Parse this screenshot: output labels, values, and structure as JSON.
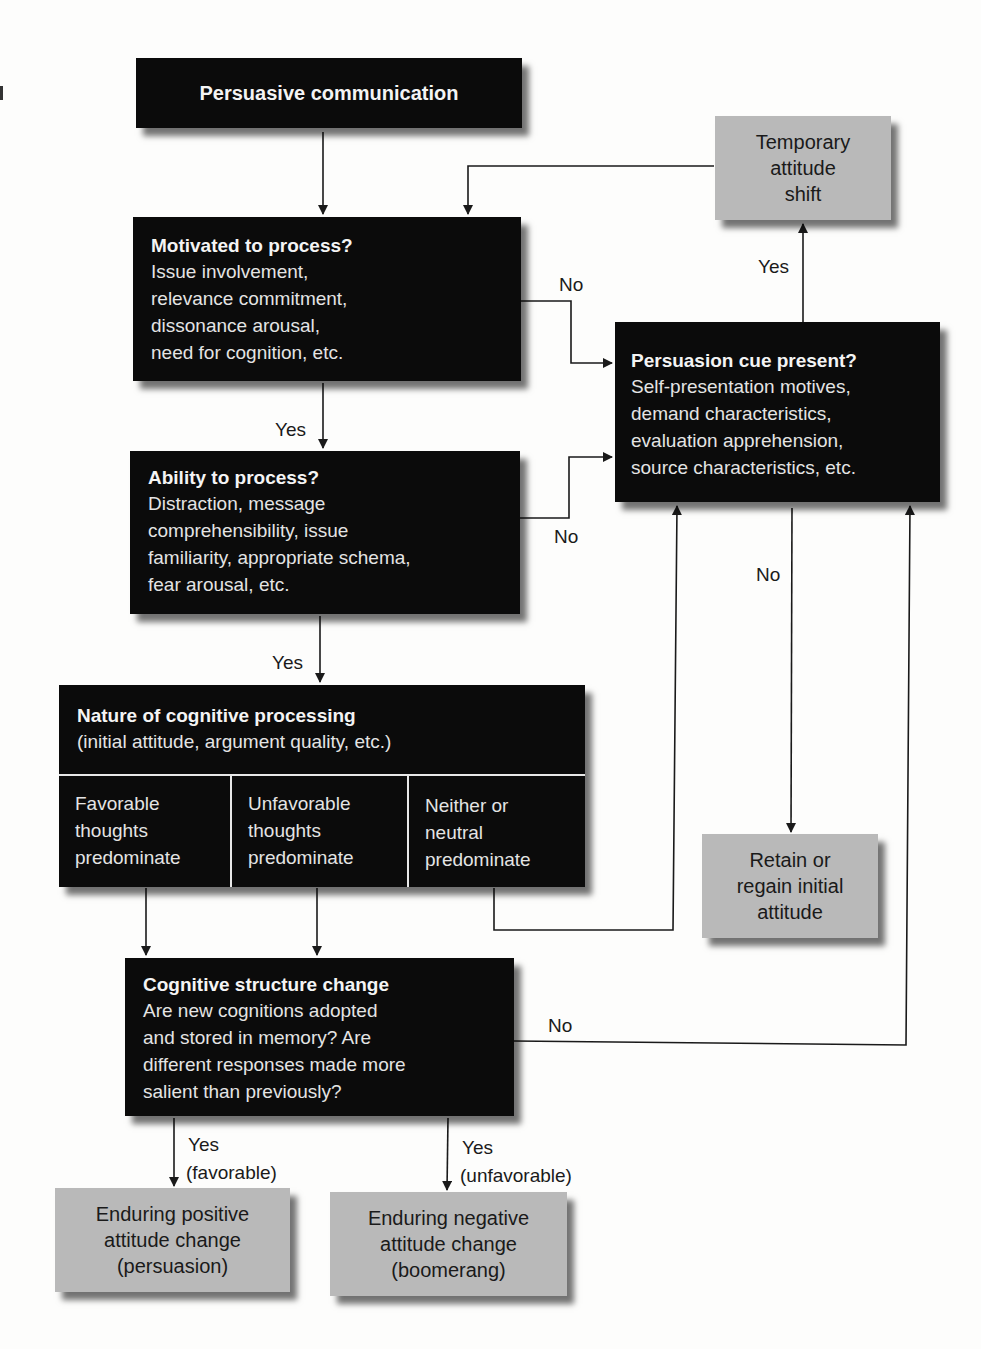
{
  "diagram": {
    "nodes": {
      "persuasive_communication": {
        "title": "Persuasive communication"
      },
      "motivated": {
        "title": "Motivated to process?",
        "lines": [
          "Issue involvement,",
          "relevance commitment,",
          "dissonance arousal,",
          "need for cognition, etc."
        ]
      },
      "ability": {
        "title": "Ability to process?",
        "lines": [
          "Distraction, message",
          "comprehensibility, issue",
          "familiarity, appropriate schema,",
          "fear arousal, etc."
        ]
      },
      "nature": {
        "title": "Nature of cognitive processing",
        "subtitle": "(initial attitude, argument quality, etc.)",
        "cells": [
          {
            "lines": [
              "Favorable",
              "thoughts",
              "predominate"
            ]
          },
          {
            "lines": [
              "Unfavorable",
              "thoughts",
              "predominate"
            ]
          },
          {
            "lines": [
              "Neither or",
              "neutral",
              "predominate"
            ]
          }
        ]
      },
      "cognitive_change": {
        "title": "Cognitive structure change",
        "lines": [
          "Are new cognitions adopted",
          "and stored in memory? Are",
          "different responses made more",
          "salient than previously?"
        ]
      },
      "cue": {
        "title": "Persuasion cue present?",
        "lines": [
          "Self-presentation motives,",
          "demand characteristics,",
          "evaluation apprehension,",
          "source characteristics, etc."
        ]
      },
      "temporary": {
        "lines": [
          "Temporary",
          "attitude",
          "shift"
        ]
      },
      "retain": {
        "lines": [
          "Retain or",
          "regain initial",
          "attitude"
        ]
      },
      "positive": {
        "lines": [
          "Enduring positive",
          "attitude change",
          "(persuasion)"
        ]
      },
      "negative": {
        "lines": [
          "Enduring negative",
          "attitude change",
          "(boomerang)"
        ]
      }
    },
    "edge_labels": {
      "motivated_no": "No",
      "motivated_yes": "Yes",
      "ability_no": "No",
      "ability_yes": "Yes",
      "cue_yes": "Yes",
      "cue_no": "No",
      "change_no": "No",
      "change_yes_fav_1": "Yes",
      "change_yes_fav_2": "(favorable)",
      "change_yes_unfav_1": "Yes",
      "change_yes_unfav_2": "(unfavorable)"
    },
    "colors": {
      "dark_box": "#0b0b0b",
      "light_box": "#b9b9b9",
      "line": "#1a1a1a",
      "background": "#fdfdfc"
    }
  }
}
